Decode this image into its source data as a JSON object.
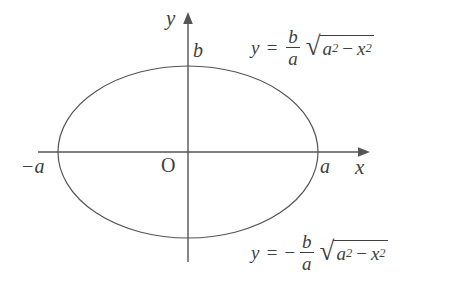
{
  "figure": {
    "background_color": "#ffffff",
    "stroke_color": "#555555",
    "text_color": "#3f3f3f"
  },
  "axes": {
    "x_label": "x",
    "y_label": "y",
    "origin_label": "O",
    "x_axis": {
      "start_px": 38,
      "end_px": 370,
      "y_px": 152,
      "arrow": "right"
    },
    "y_axis": {
      "start_px": 262,
      "end_px": 12,
      "x_px": 188,
      "arrow": "up"
    }
  },
  "ticks": {
    "right_vertex": "a",
    "left_vertex": "−a",
    "top_vertex": "b"
  },
  "curve": {
    "type": "ellipse",
    "center_px": [
      188,
      152
    ],
    "semi_axis_x_px": 130,
    "semi_axis_y_px": 86
  },
  "equations": {
    "upper": {
      "lhs": "y",
      "equals": "=",
      "sign": "",
      "fraction": {
        "numerator": "b",
        "denominator": "a"
      },
      "radical_sign": "√",
      "radicand": {
        "first": "a",
        "first_exp": "2",
        "operator": "−",
        "second": "x",
        "second_exp": "2"
      },
      "plain": "y = (b/a)√(a² − x²)"
    },
    "lower": {
      "lhs": "y",
      "equals": "=",
      "sign": "−",
      "fraction": {
        "numerator": "b",
        "denominator": "a"
      },
      "radical_sign": "√",
      "radicand": {
        "first": "a",
        "first_exp": "2",
        "operator": "−",
        "second": "x",
        "second_exp": "2"
      },
      "plain": "y = −(b/a)√(a² − x²)"
    }
  }
}
